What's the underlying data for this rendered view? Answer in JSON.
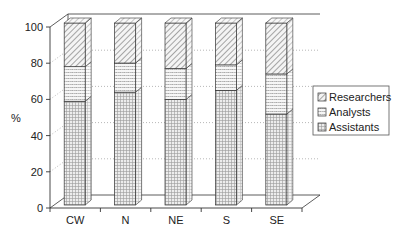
{
  "chart_data": {
    "type": "bar",
    "stacked": true,
    "three_d": true,
    "title": "",
    "xlabel": "",
    "ylabel": "%",
    "ylim": [
      0,
      100
    ],
    "yticks": [
      0,
      20,
      40,
      60,
      80,
      100
    ],
    "grid": "dotted horizontal on back wall and side wall",
    "legend_position": "right",
    "categories": [
      "CW",
      "N",
      "NE",
      "S",
      "SE"
    ],
    "series": [
      {
        "name": "Assistants",
        "pattern": "grid",
        "values": [
          57,
          62,
          58,
          63,
          50
        ]
      },
      {
        "name": "Analysts",
        "pattern": "horizontal-lines",
        "values": [
          19,
          16,
          17,
          14,
          22
        ]
      },
      {
        "name": "Researchers",
        "pattern": "diagonal-hatch",
        "values": [
          24,
          22,
          25,
          23,
          28
        ]
      }
    ],
    "legend_order": [
      "Researchers",
      "Analysts",
      "Assistants"
    ]
  },
  "axis": {
    "y_title": "%",
    "y_tick_labels": [
      "0",
      "20",
      "40",
      "60",
      "80",
      "100"
    ]
  },
  "legend": {
    "items": [
      {
        "label": "Researchers",
        "pattern": "diagonal-hatch"
      },
      {
        "label": "Analysts",
        "pattern": "horizontal-lines"
      },
      {
        "label": "Assistants",
        "pattern": "grid"
      }
    ]
  },
  "colors": {
    "line": "#333333",
    "grid": "#999999",
    "fill": "#e6e6e6",
    "background": "#ffffff"
  }
}
